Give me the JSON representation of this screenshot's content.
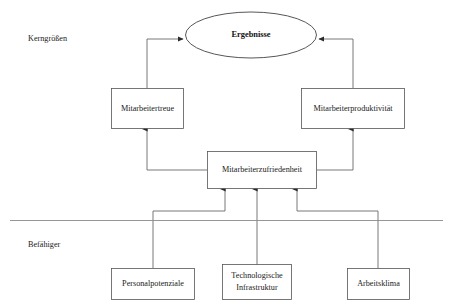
{
  "diagram": {
    "bands": [
      {
        "id": "kerngroessen",
        "label": "Kerngrößen"
      },
      {
        "id": "befaehiger",
        "label": "Befähiger"
      }
    ],
    "nodes": {
      "ergebnisse": {
        "label": "Ergebnisse",
        "shape": "ellipse"
      },
      "mitarbeitertreue": {
        "label": "Mitarbeitertreue",
        "shape": "rect"
      },
      "mitarbeiterproduktivitaet": {
        "label": "Mitarbeiterproduktivität",
        "shape": "rect"
      },
      "mitarbeiterzufriedenheit": {
        "label": "Mitarbeiterzufriedenheit",
        "shape": "rect"
      },
      "personalpotenziale": {
        "label": "Personalpotenziale",
        "shape": "rect"
      },
      "technologische_infrastruktur": {
        "label_line1": "Technologische",
        "label_line2": "Infrastruktur",
        "shape": "rect"
      },
      "arbeitsklima": {
        "label": "Arbeitsklima",
        "shape": "rect"
      }
    },
    "edges": [
      {
        "from": "mitarbeitertreue",
        "to": "ergebnisse"
      },
      {
        "from": "mitarbeiterproduktivitaet",
        "to": "ergebnisse"
      },
      {
        "from": "mitarbeiterzufriedenheit",
        "to": "mitarbeitertreue"
      },
      {
        "from": "mitarbeiterzufriedenheit",
        "to": "mitarbeiterproduktivitaet"
      },
      {
        "from": "personalpotenziale",
        "to": "mitarbeiterzufriedenheit"
      },
      {
        "from": "technologische_infrastruktur",
        "to": "mitarbeiterzufriedenheit"
      },
      {
        "from": "arbeitsklima",
        "to": "mitarbeiterzufriedenheit"
      }
    ],
    "colors": {
      "background": "#ffffff",
      "box_stroke": "#555555",
      "connector": "#6a6a6a",
      "divider": "#8a8a8a",
      "text": "#1a1a1a"
    }
  }
}
